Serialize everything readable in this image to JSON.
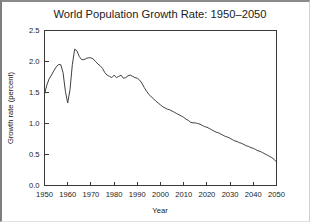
{
  "figure": {
    "title": "World Population Growth Rate: 1950–2050",
    "background_color": "#ffffff",
    "line_color": "#404040",
    "axis_color": "#3a3a3a",
    "text_color": "#1a1a1a"
  },
  "chart_data": {
    "type": "line",
    "title": "World Population Growth Rate: 1950–2050",
    "xlabel": "Year",
    "ylabel": "Growth rate (percent)",
    "xlim": [
      1950,
      2050
    ],
    "ylim": [
      0.0,
      2.5
    ],
    "grid": false,
    "legend": "none",
    "xticks": [
      1950,
      1960,
      1970,
      1980,
      1990,
      2000,
      2010,
      2020,
      2030,
      2040,
      2050
    ],
    "xtick_labels": [
      "1950",
      "1960",
      "1970",
      "1980",
      "1990",
      "2000",
      "2010",
      "2020",
      "2030",
      "2040",
      "2050"
    ],
    "yticks": [
      0.0,
      0.5,
      1.0,
      1.5,
      2.0,
      2.5
    ],
    "ytick_labels": [
      "0.0",
      "0.5",
      "1.0",
      "1.5",
      "2.0",
      "2.5"
    ],
    "series": [
      {
        "name": "World population growth rate",
        "x": [
          1950,
          1951,
          1952,
          1953,
          1954,
          1955,
          1956,
          1957,
          1958,
          1959,
          1960,
          1961,
          1962,
          1963,
          1964,
          1965,
          1966,
          1967,
          1968,
          1969,
          1970,
          1971,
          1972,
          1973,
          1974,
          1975,
          1976,
          1977,
          1978,
          1979,
          1980,
          1981,
          1982,
          1983,
          1984,
          1985,
          1986,
          1987,
          1988,
          1989,
          1990,
          1991,
          1992,
          1993,
          1994,
          1995,
          1996,
          1997,
          1998,
          1999,
          2000,
          2001,
          2002,
          2003,
          2004,
          2005,
          2006,
          2007,
          2008,
          2009,
          2010,
          2011,
          2012,
          2013,
          2014,
          2015,
          2016,
          2017,
          2018,
          2019,
          2020,
          2021,
          2022,
          2023,
          2024,
          2025,
          2026,
          2027,
          2028,
          2029,
          2030,
          2031,
          2032,
          2033,
          2034,
          2035,
          2036,
          2037,
          2038,
          2039,
          2040,
          2041,
          2042,
          2043,
          2044,
          2045,
          2046,
          2047,
          2048,
          2049,
          2050
        ],
        "y": [
          1.47,
          1.62,
          1.72,
          1.78,
          1.85,
          1.91,
          1.95,
          1.95,
          1.82,
          1.52,
          1.33,
          1.55,
          1.95,
          2.2,
          2.17,
          2.08,
          2.03,
          2.03,
          2.05,
          2.06,
          2.06,
          2.04,
          2.0,
          1.96,
          1.93,
          1.89,
          1.82,
          1.78,
          1.76,
          1.74,
          1.78,
          1.74,
          1.76,
          1.78,
          1.73,
          1.74,
          1.77,
          1.78,
          1.76,
          1.74,
          1.73,
          1.7,
          1.65,
          1.58,
          1.52,
          1.47,
          1.43,
          1.4,
          1.36,
          1.33,
          1.3,
          1.27,
          1.25,
          1.23,
          1.22,
          1.2,
          1.18,
          1.16,
          1.14,
          1.12,
          1.1,
          1.07,
          1.05,
          1.02,
          1.01,
          1.01,
          1.0,
          0.99,
          0.97,
          0.95,
          0.94,
          0.92,
          0.9,
          0.88,
          0.86,
          0.85,
          0.83,
          0.81,
          0.79,
          0.78,
          0.76,
          0.74,
          0.72,
          0.71,
          0.69,
          0.68,
          0.66,
          0.64,
          0.63,
          0.61,
          0.6,
          0.58,
          0.56,
          0.55,
          0.53,
          0.51,
          0.49,
          0.47,
          0.45,
          0.42,
          0.38
        ]
      }
    ]
  }
}
